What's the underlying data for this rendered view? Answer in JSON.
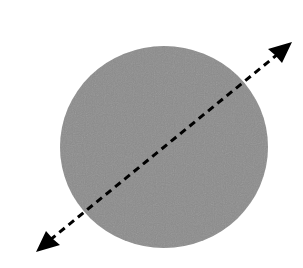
{
  "diagram": {
    "background": "#ffffff",
    "disc": {
      "shape": "circle",
      "cx": 164,
      "cy": 147,
      "rx": 104,
      "ry": 101,
      "fill": "#8c8c8c"
    },
    "axis_line": {
      "style": "dashed",
      "double_headed_arrow": true,
      "x1": 36,
      "y1": 252,
      "x2": 292,
      "y2": 42,
      "color": "#000000",
      "dash": "7,5",
      "stroke_width": 3
    },
    "icons": [
      "arrowhead-upper-right",
      "arrowhead-lower-left"
    ]
  }
}
